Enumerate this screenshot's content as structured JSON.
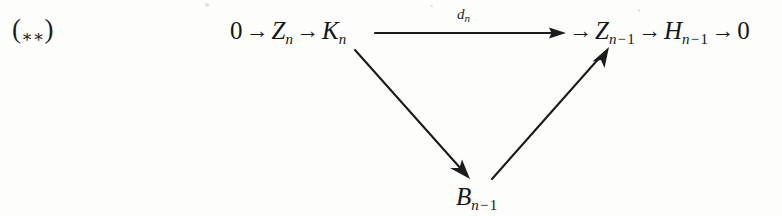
{
  "figure": {
    "tag": {
      "open_paren": "(",
      "stars": "∗∗",
      "close_paren": ")"
    },
    "sequence_left": {
      "zero": "0",
      "arrow1": "→",
      "term_z_n": "Z",
      "sub_z_n": "n",
      "arrow2": "→",
      "term_k_n": "K",
      "sub_k_n": "n"
    },
    "long_arrow": {
      "label_symbol": "d",
      "label_subscript": "n",
      "direction": "right"
    },
    "sequence_right": {
      "arrow3": "→",
      "term_z_n_minus_1": "Z",
      "sub_n": "n",
      "sub_minus": "−",
      "sub_one": "1",
      "arrow4": "→",
      "term_h_n_minus_1": "H",
      "arrow5": "→",
      "zero": "0"
    },
    "vertex_bottom": {
      "term_b": "B",
      "sub_n": "n",
      "sub_minus": "−",
      "sub_one": "1"
    },
    "diagonals": [
      {
        "name": "k-n-to-b-n-minus-1",
        "from": "K_n",
        "to": "B_{n-1}",
        "direction": "down-right"
      },
      {
        "name": "b-n-minus-1-to-z-n-minus-1",
        "from": "B_{n-1}",
        "to": "Z_{n-1}",
        "direction": "up-right"
      }
    ],
    "colors": {
      "ink": "#1b1b1b",
      "paper": "#fdfdfc"
    }
  }
}
